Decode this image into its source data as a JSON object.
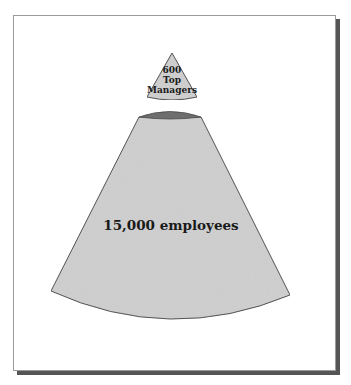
{
  "diagram": {
    "top_cone": {
      "lines": [
        "600",
        "Top",
        "Managers"
      ]
    },
    "bottom_cone": {
      "label": "15,000 employees"
    },
    "colors": {
      "cone_fill": "#cfcfcf",
      "cone_stroke": "#4a4a4a",
      "cap_fill": "#6e6e6e",
      "frame_border": "#9a9a9a",
      "frame_shadow": "#555555"
    }
  }
}
